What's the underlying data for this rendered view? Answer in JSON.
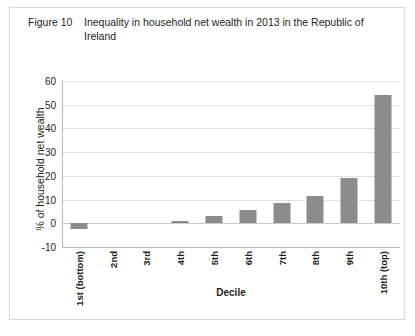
{
  "figure": {
    "label": "Figure 10",
    "caption": "Inequality in household net wealth in 2013 in the Republic of Ireland"
  },
  "chart_data": {
    "type": "bar",
    "title": "Inequality in household net wealth in 2013 in the Republic of Ireland",
    "xlabel": "Decile",
    "ylabel": "% of household net wealth",
    "categories": [
      "1st (bottom)",
      "2nd",
      "3rd",
      "4th",
      "5th",
      "6th",
      "7th",
      "8th",
      "9th",
      "10th (top)"
    ],
    "values": [
      -2.5,
      0,
      0,
      1,
      3,
      5.5,
      8.5,
      11.5,
      19,
      54
    ],
    "ylim": [
      -10,
      60
    ],
    "yticks": [
      60,
      50,
      40,
      30,
      20,
      10,
      0,
      -10
    ],
    "ytick_labels": [
      "60",
      "50",
      "40",
      "30",
      "20",
      "10",
      "0",
      "-10"
    ],
    "grid": true,
    "legend": null,
    "bar_color": "#8c8c8c",
    "gridline_color": "#e2e2e2"
  }
}
